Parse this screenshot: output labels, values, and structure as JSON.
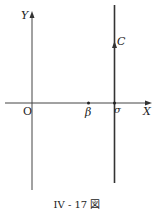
{
  "figure": {
    "caption": "IV - 17 図",
    "labels": {
      "y_axis": "Y",
      "x_axis": "X",
      "origin": "O",
      "beta": "β",
      "sigma": "σ",
      "contour": "C"
    },
    "colors": {
      "line": "#333333",
      "background": "#ffffff"
    }
  }
}
